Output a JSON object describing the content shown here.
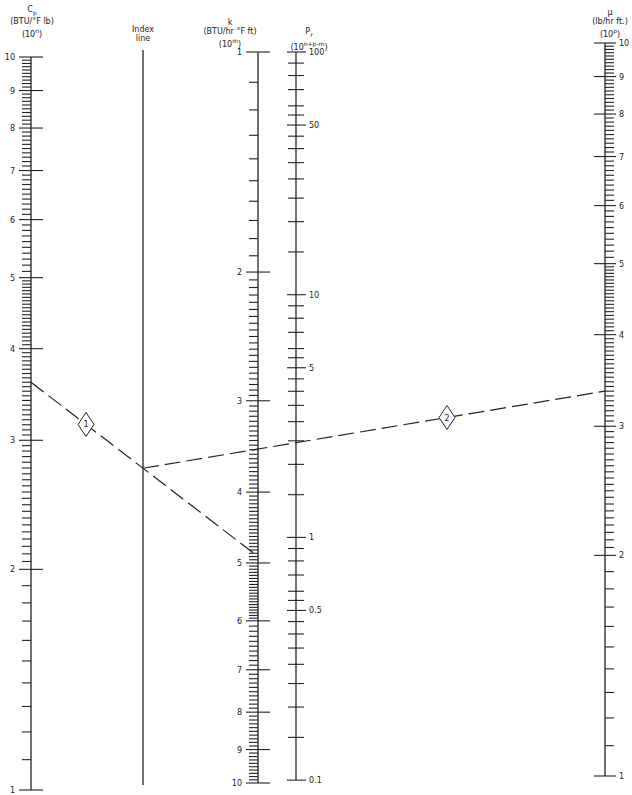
{
  "headers": {
    "cp": {
      "symbol": "C",
      "sub": "p",
      "units": "(BTU/°F lb)",
      "scale": "(10",
      "scale_exp": "n",
      "scale_close": ")"
    },
    "index": {
      "line1": "Index",
      "line2": "line"
    },
    "k": {
      "symbol": "k",
      "units": "(BTU/hr °F ft)",
      "scale": "(10",
      "scale_exp": "m",
      "scale_close": ")"
    },
    "pr": {
      "symbol": "P",
      "sub": "r",
      "scale": "(10",
      "scale_exp": "n+p-m",
      "scale_close": ")"
    },
    "mu": {
      "symbol": "μ",
      "units": "(lb/hr ft.)",
      "scale": "(10",
      "scale_exp": "p",
      "scale_close": ")"
    }
  },
  "axes": {
    "cp": {
      "x": 31,
      "labels": [
        "1",
        "2",
        "3",
        "4",
        "5",
        "6",
        "7",
        "8",
        "9",
        "10"
      ],
      "label_side": "left"
    },
    "index": {
      "x": 143,
      "y_top": 50,
      "y_bottom": 785
    },
    "k": {
      "x": 258,
      "labels": [
        "1",
        "2",
        "3",
        "4",
        "5",
        "6",
        "7",
        "8",
        "9",
        "10"
      ],
      "label_side": "left"
    },
    "pr": {
      "x": 296,
      "labels": [
        "100",
        "50",
        "10",
        "5",
        "1",
        "0.5",
        "0.1"
      ],
      "label_side": "right"
    },
    "mu": {
      "x": 605,
      "labels": [
        "1",
        "2",
        "3",
        "4",
        "5",
        "6",
        "7",
        "8",
        "9",
        "10"
      ],
      "label_side": "right"
    }
  },
  "example_lines": [
    {
      "id": "1",
      "from_axis": "Cp",
      "from_value": 3.6,
      "pivot": "Index line",
      "to_axis": "k",
      "to_value": 4.9
    },
    {
      "id": "2",
      "from_axis": "Index line",
      "pivot": "Index line",
      "to_axis": "μ",
      "to_value": 3.35,
      "crosses_pr": 2.3
    }
  ],
  "markers": [
    "1",
    "2"
  ]
}
